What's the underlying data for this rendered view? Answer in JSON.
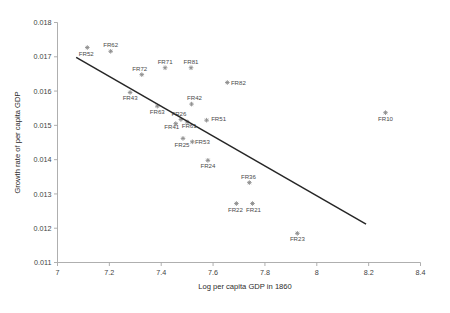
{
  "chart_data": {
    "type": "scatter",
    "title": "",
    "xlabel": "Log per capita GDP in 1860",
    "ylabel": "Growth rate of per capita GDP",
    "xlim": [
      7.0,
      8.4
    ],
    "ylim": [
      0.011,
      0.018
    ],
    "xticks": [
      "7",
      "7.2",
      "7.4",
      "7.6",
      "7.8",
      "8",
      "8.2",
      "8.4"
    ],
    "xtick_values": [
      7.0,
      7.2,
      7.4,
      7.6,
      7.8,
      8.0,
      8.2,
      8.4
    ],
    "yticks": [
      "0.011",
      "0.012",
      "0.013",
      "0.014",
      "0.015",
      "0.016",
      "0.017",
      "0.018"
    ],
    "ytick_values": [
      0.011,
      0.012,
      0.013,
      0.014,
      0.015,
      0.016,
      0.017,
      0.018
    ],
    "grid": false,
    "legend": "none",
    "marker_color": "#8c8c8c",
    "trendline_color": "#262626",
    "axis_color": "#a6a6a6",
    "points": [
      {
        "label": "FR52",
        "x": 7.115,
        "y": 0.01727,
        "lx": -1,
        "ly": 8
      },
      {
        "label": "FR62",
        "x": 7.205,
        "y": 0.01716,
        "lx": 0,
        "ly": -4
      },
      {
        "label": "FR72",
        "x": 7.325,
        "y": 0.01648,
        "lx": -2,
        "ly": -4
      },
      {
        "label": "FR71",
        "x": 7.415,
        "y": 0.01668,
        "lx": 0,
        "ly": -4
      },
      {
        "label": "FR81",
        "x": 7.515,
        "y": 0.01668,
        "lx": 0,
        "ly": -4
      },
      {
        "label": "FR82",
        "x": 7.655,
        "y": 0.01625,
        "lx": 11,
        "ly": 2
      },
      {
        "label": "FR43",
        "x": 7.28,
        "y": 0.01596,
        "lx": 0,
        "ly": 8
      },
      {
        "label": "FR63",
        "x": 7.385,
        "y": 0.01556,
        "lx": 0,
        "ly": 8
      },
      {
        "label": "FR42",
        "x": 7.517,
        "y": 0.01562,
        "lx": 3,
        "ly": -4
      },
      {
        "label": "FR51",
        "x": 7.575,
        "y": 0.01515,
        "lx": 12,
        "ly": 1
      },
      {
        "label": "FR26",
        "x": 7.476,
        "y": 0.01517,
        "lx": -2,
        "ly": -4
      },
      {
        "label": "FR41",
        "x": 7.456,
        "y": 0.01505,
        "lx": -4,
        "ly": 5
      },
      {
        "label": "FR61",
        "x": 7.5,
        "y": 0.0151,
        "lx": 2,
        "ly": 6
      },
      {
        "label": "FR53",
        "x": 7.52,
        "y": 0.01452,
        "lx": 10,
        "ly": 2
      },
      {
        "label": "FR25",
        "x": 7.484,
        "y": 0.01462,
        "lx": -1,
        "ly": 9
      },
      {
        "label": "FR24",
        "x": 7.58,
        "y": 0.01398,
        "lx": 0,
        "ly": 8
      },
      {
        "label": "FR36",
        "x": 7.74,
        "y": 0.01333,
        "lx": -1,
        "ly": -4
      },
      {
        "label": "FR22",
        "x": 7.69,
        "y": 0.01272,
        "lx": -1,
        "ly": 8
      },
      {
        "label": "FR21",
        "x": 7.752,
        "y": 0.01272,
        "lx": 1,
        "ly": 8
      },
      {
        "label": "FR23",
        "x": 7.925,
        "y": 0.01185,
        "lx": 0,
        "ly": 8
      },
      {
        "label": "FR10",
        "x": 8.265,
        "y": 0.01537,
        "lx": 0,
        "ly": 8
      }
    ],
    "trendline": {
      "x0": 7.072,
      "y0": 0.01698,
      "x1": 8.19,
      "y1": 0.01212
    }
  }
}
